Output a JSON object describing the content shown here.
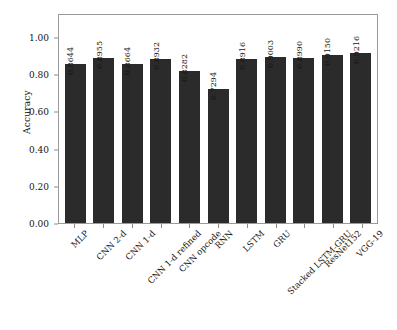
{
  "chart_data": {
    "type": "bar",
    "title": "",
    "xlabel": "",
    "ylabel": "Accuracy",
    "ylim": [
      0.0,
      1.13
    ],
    "grid": false,
    "legend": null,
    "orientation": "vertical",
    "bar_color": "#2b2b2b",
    "frame_color": "#9a9a9a",
    "categories": [
      "MLP",
      "CNN 2-d",
      "CNN 1-d",
      "CNN 1-d refined",
      "CNN opcode",
      "RNN",
      "LSTM",
      "GRU",
      "Stacked LSTM-GRU",
      "ResNet152",
      "VGG-19"
    ],
    "values": [
      0.8644,
      0.8955,
      0.8664,
      0.8932,
      0.8282,
      0.7294,
      0.8916,
      0.9003,
      0.899,
      0.915,
      0.9216
    ],
    "value_labels": [
      "0.8644",
      "0.8955",
      "0.8664",
      "0.8932",
      "0.8282",
      "0.7294",
      "0.8916",
      "0.9003",
      "0.8990",
      "0.9150",
      "0.9216"
    ],
    "ytick_values": [
      0.0,
      0.2,
      0.4,
      0.6,
      0.8,
      1.0
    ],
    "ytick_labels": [
      "0.00",
      "0.20",
      "0.40",
      "0.60",
      "0.80",
      "1.00"
    ]
  }
}
